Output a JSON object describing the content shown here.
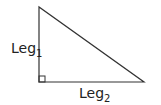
{
  "diagram": {
    "type": "right-triangle",
    "stroke_color": "#333333",
    "vertices": {
      "top": [
        39,
        7
      ],
      "right_angle": [
        39,
        82
      ],
      "bottom_right": [
        144,
        82
      ]
    },
    "right_angle_marker_size": 6,
    "labels": {
      "leg1": {
        "text": "Leg",
        "subscript": "1"
      },
      "leg2": {
        "text": "Leg",
        "subscript": "2"
      }
    }
  }
}
